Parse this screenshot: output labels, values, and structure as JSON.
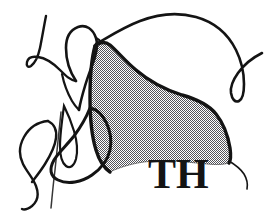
{
  "artwork": {
    "title": "Abstract line drawing with halftone shaded region",
    "medium": "ink line art",
    "background_color": "#ffffff",
    "ink_color": "#141414",
    "halftone": {
      "pattern": "fine checkerboard dot screen",
      "dot_color": "#55555a",
      "cell_size_px": 2,
      "coverage": "approximately 50 percent"
    },
    "monogram": {
      "text": "TH",
      "style": "serif capitals",
      "color": "#141414"
    },
    "strokes": [
      {
        "name": "upper-left-hook",
        "description": "Tapering curve descending from top left, hooking leftward into a rounded foot"
      },
      {
        "name": "upper-left-loop",
        "description": "Tall narrow loop rising to a rounded crest then descending to a point"
      },
      {
        "name": "long-upper-arc",
        "description": "Long sweeping arc running across the top right and curving down into a narrow U"
      },
      {
        "name": "shaded-body-outline",
        "description": "Large bulbous outlined form filled with halftone screen, spanning center to right"
      },
      {
        "name": "lower-left-teardrop",
        "description": "Teardrop-shaped loop at the lower left tapering to a fine tail"
      },
      {
        "name": "lower-left-spike",
        "description": "Slender pointed spike rising from the lower left"
      },
      {
        "name": "lower-descender",
        "description": "Long thin stroke descending to the bottom edge"
      },
      {
        "name": "right-descender",
        "description": "Thin stroke descending from the shaded form down the right side"
      }
    ]
  }
}
